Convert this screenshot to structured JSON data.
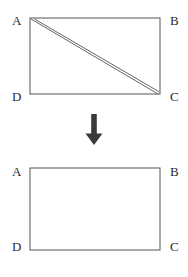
{
  "diagram": {
    "stroke_color": "#555555",
    "label_color": "#2b2b2b",
    "background_color": "#ffffff",
    "arrow_color": "#3a3a3a",
    "top_figure": {
      "name": "rectangle-with-diagonal-strip",
      "vertices": {
        "a": "A",
        "b": "B",
        "c": "C",
        "d": "D"
      },
      "rect": {
        "x": 30,
        "y": 18,
        "width": 130,
        "height": 76
      },
      "diagonal": {
        "from": "A",
        "to": "C",
        "lines": 2,
        "offset_px": 4,
        "description": "two parallel lines from A to C forming a thin strip"
      }
    },
    "arrow": {
      "name": "down-arrow",
      "direction": "down",
      "glyph": "↓"
    },
    "bottom_figure": {
      "name": "plain-rectangle",
      "vertices": {
        "a": "A",
        "b": "B",
        "c": "C",
        "d": "D"
      },
      "rect": {
        "x": 30,
        "y": 18,
        "width": 130,
        "height": 82
      }
    }
  }
}
